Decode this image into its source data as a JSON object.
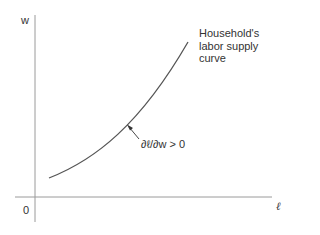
{
  "diagram": {
    "type": "supply-curve",
    "y_axis_label": "w",
    "x_axis_label": "ℓ",
    "origin_label": "0",
    "curve_label": "Household's labor supply curve",
    "curve_label_lines": [
      "Household's",
      "labor supply",
      "curve"
    ],
    "annotation": "∂ℓ/∂w > 0",
    "colors": {
      "axis": "#9a9a9a",
      "curve": "#555555",
      "text": "#333333"
    }
  }
}
